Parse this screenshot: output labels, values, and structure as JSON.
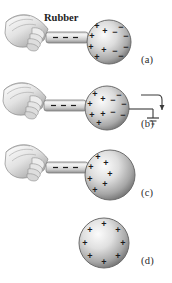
{
  "figure": {
    "background_color": "#ffffff",
    "ink_color": "#1a1a1a",
    "sphere_color_light": "#f2f2f2",
    "sphere_color_mid": "#b9b9b9",
    "sphere_color_dark": "#7a7a7a",
    "rod_color_light": "#efefef",
    "rod_color_dark": "#9a9a9a",
    "hand_color_light": "#f7f7f7",
    "hand_color_dark": "#8d8d8d"
  },
  "labels": {
    "rubber": "Rubber",
    "panel_a": "(a)",
    "panel_b": "(b)",
    "panel_c": "(c)",
    "panel_d": "(d)"
  },
  "glyphs": {
    "plus": "+",
    "minus": "−"
  },
  "panels": [
    {
      "id": "a",
      "label": "(a)",
      "caption_label": "Rubber",
      "has_hand": true,
      "has_rod": true,
      "has_ground_wire": false,
      "rod_charges": [
        "−",
        "−",
        "−"
      ],
      "sphere": {
        "cx": 109,
        "cy": 42,
        "r": 22,
        "plus_count": 6,
        "minus_count": 6,
        "plus_positions": [
          {
            "x": 97,
            "y": 26
          },
          {
            "x": 92,
            "y": 36
          },
          {
            "x": 91,
            "y": 47
          },
          {
            "x": 96,
            "y": 57
          },
          {
            "x": 105,
            "y": 31
          },
          {
            "x": 104,
            "y": 50
          }
        ],
        "minus_positions": [
          {
            "x": 120,
            "y": 27
          },
          {
            "x": 125,
            "y": 36
          },
          {
            "x": 126,
            "y": 47
          },
          {
            "x": 121,
            "y": 56
          },
          {
            "x": 114,
            "y": 32
          },
          {
            "x": 115,
            "y": 51
          }
        ]
      }
    },
    {
      "id": "b",
      "label": "(b)",
      "caption_label": "",
      "has_hand": true,
      "has_rod": true,
      "has_ground_wire": true,
      "rod_charges": [
        "−",
        "−",
        "−"
      ],
      "sphere": {
        "cx": 107,
        "cy": 108,
        "r": 22,
        "plus_count": 6,
        "minus_count": 5,
        "plus_positions": [
          {
            "x": 95,
            "y": 94
          },
          {
            "x": 90,
            "y": 104
          },
          {
            "x": 92,
            "y": 115
          },
          {
            "x": 99,
            "y": 123
          },
          {
            "x": 103,
            "y": 99
          },
          {
            "x": 103,
            "y": 114
          }
        ],
        "minus_positions": [
          {
            "x": 118,
            "y": 95
          },
          {
            "x": 123,
            "y": 104
          },
          {
            "x": 122,
            "y": 115
          },
          {
            "x": 113,
            "y": 100
          },
          {
            "x": 113,
            "y": 112
          }
        ]
      },
      "ground": {
        "wire_label": "",
        "arrow_direction": "down",
        "symbol": "earth-ground"
      }
    },
    {
      "id": "c",
      "label": "(c)",
      "caption_label": "",
      "has_hand": true,
      "has_rod": true,
      "has_ground_wire": false,
      "rod_charges": [
        "−",
        "−",
        "−"
      ],
      "sphere": {
        "cx": 110,
        "cy": 175,
        "r": 25,
        "plus_count": 7,
        "minus_count": 0,
        "plus_positions": [
          {
            "x": 97,
            "y": 157
          },
          {
            "x": 90,
            "y": 167
          },
          {
            "x": 89,
            "y": 179
          },
          {
            "x": 94,
            "y": 190
          },
          {
            "x": 105,
            "y": 163
          },
          {
            "x": 104,
            "y": 184
          },
          {
            "x": 109,
            "y": 173
          }
        ],
        "minus_positions": []
      }
    },
    {
      "id": "d",
      "label": "(d)",
      "caption_label": "",
      "has_hand": false,
      "has_rod": false,
      "has_ground_wire": false,
      "rod_charges": [],
      "sphere": {
        "cx": 104,
        "cy": 243,
        "r": 25,
        "plus_count": 8,
        "minus_count": 0,
        "plus_positions": [
          {
            "x": 104,
            "y": 224
          },
          {
            "x": 118,
            "y": 230
          },
          {
            "x": 123,
            "y": 243
          },
          {
            "x": 118,
            "y": 256
          },
          {
            "x": 104,
            "y": 262
          },
          {
            "x": 90,
            "y": 256
          },
          {
            "x": 85,
            "y": 243
          },
          {
            "x": 90,
            "y": 230
          }
        ],
        "minus_positions": []
      }
    }
  ]
}
